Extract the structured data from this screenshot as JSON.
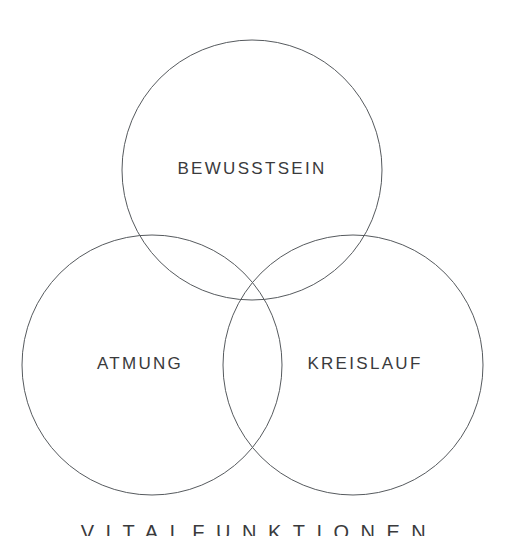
{
  "page": {
    "title": "Vitalfunktionen",
    "background_color": "#ffffff",
    "width": 507,
    "height": 536
  },
  "diagram": {
    "type": "venn",
    "set_count": 3,
    "stroke_color": "#565a5e",
    "stroke_width": 1,
    "label_color": "#3a3a3c",
    "circles": [
      {
        "id": "bewusstsein",
        "label": "BEWUSSTSEIN",
        "cx": 252,
        "cy": 170,
        "r": 130,
        "label_x": 252,
        "label_y": 170
      },
      {
        "id": "atmung",
        "label": "ATMUNG",
        "cx": 152,
        "cy": 365,
        "r": 130,
        "label_x": 140,
        "label_y": 365
      },
      {
        "id": "kreislauf",
        "label": "KREISLAUF",
        "cx": 353,
        "cy": 365,
        "r": 130,
        "label_x": 365,
        "label_y": 365
      }
    ]
  },
  "footer": {
    "caption": "VITALFUNKTIONEN"
  }
}
